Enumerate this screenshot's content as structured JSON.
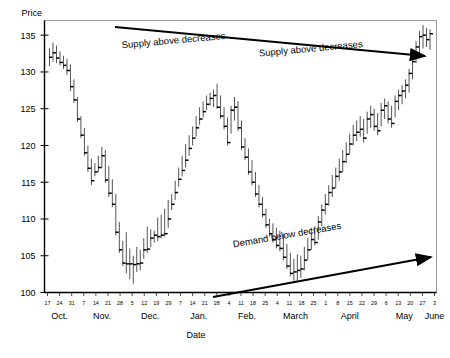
{
  "chart_data": {
    "type": "bar",
    "title": "",
    "subtitle": "",
    "ylabel": "Price",
    "xlabel": "Date",
    "ylim": [
      100,
      137
    ],
    "yticks": [
      100,
      105,
      110,
      115,
      120,
      125,
      130,
      135
    ],
    "grid": false,
    "legend": null,
    "style": "ohlc-hlc-price-bars",
    "annotations": [
      {
        "name": "supply-arrow-label-1",
        "text": "Supply above decreases",
        "x": 0.33,
        "y": 0.085,
        "rotate": -5.2
      },
      {
        "name": "supply-arrow-label-2",
        "text": "Supply above decreases",
        "x": 0.68,
        "y": 0.115,
        "rotate": -5.2
      },
      {
        "name": "demand-arrow-label",
        "text": "Demand below decreases",
        "x": 0.62,
        "y": 0.8,
        "rotate": -9.8
      }
    ],
    "arrows": [
      {
        "name": "supply-trendline-arrow",
        "x1": 115,
        "y1": 27,
        "x2": 425,
        "y2": 56,
        "direction": "down-right"
      },
      {
        "name": "demand-trendline-arrow",
        "x1": 213,
        "y1": 297,
        "x2": 431,
        "y2": 257,
        "direction": "up-right"
      }
    ],
    "month_labels": [
      "Oct.",
      "Nov.",
      "Dec.",
      "Jan.",
      "Feb.",
      "March",
      "April",
      "May",
      "June"
    ],
    "day_ticks": [
      "17",
      "24",
      "31",
      "7",
      "14",
      "21",
      "28",
      "5",
      "12",
      "19",
      "29",
      "7",
      "14",
      "21",
      "28",
      "4",
      "11",
      "18",
      "25",
      "4",
      "11",
      "18",
      "25",
      "1",
      "8",
      "15",
      "22",
      "29",
      "6",
      "13",
      "20",
      "27",
      "3"
    ],
    "x": [
      "Oct 17",
      "Oct 24",
      "Oct 31",
      "Nov 7",
      "Nov 14",
      "Nov 21",
      "Nov 28",
      "Dec 5",
      "Dec 12",
      "Dec 19",
      "Dec 29",
      "Jan 7",
      "Jan 14",
      "Jan 21",
      "Jan 28",
      "Feb 4",
      "Feb 11",
      "Feb 18",
      "Feb 25",
      "Mar 4",
      "Mar 11",
      "Mar 18",
      "Mar 25",
      "Apr 1",
      "Apr 8",
      "Apr 15",
      "Apr 22",
      "Apr 29",
      "May 6",
      "May 13",
      "May 20",
      "May 27",
      "Jun 3"
    ],
    "series": [
      {
        "name": "Price (high-low-close bars)",
        "bars": [
          [
            133.2,
            130.8,
            132.0
          ],
          [
            134.0,
            131.4,
            132.6
          ],
          [
            133.6,
            131.2,
            131.9
          ],
          [
            132.8,
            130.9,
            131.3
          ],
          [
            132.2,
            130.4,
            130.9
          ],
          [
            131.8,
            129.6,
            130.2
          ],
          [
            131.0,
            127.4,
            128.0
          ],
          [
            129.0,
            125.8,
            126.2
          ],
          [
            126.6,
            123.2,
            123.6
          ],
          [
            124.0,
            121.0,
            121.4
          ],
          [
            122.4,
            118.6,
            119.0
          ],
          [
            120.0,
            116.4,
            116.9
          ],
          [
            118.2,
            114.6,
            115.2
          ],
          [
            117.6,
            115.8,
            116.4
          ],
          [
            118.6,
            116.4,
            117.0
          ],
          [
            119.8,
            116.9,
            118.6
          ],
          [
            119.4,
            114.9,
            115.3
          ],
          [
            117.2,
            113.0,
            113.5
          ],
          [
            115.4,
            111.6,
            112.0
          ],
          [
            113.4,
            107.8,
            108.2
          ],
          [
            109.6,
            105.4,
            105.8
          ],
          [
            107.0,
            103.6,
            104.0
          ],
          [
            108.2,
            102.6,
            103.9
          ],
          [
            106.0,
            101.8,
            103.9
          ],
          [
            105.0,
            101.2,
            103.8
          ],
          [
            106.2,
            102.8,
            103.9
          ],
          [
            105.8,
            103.0,
            104.0
          ],
          [
            107.4,
            104.6,
            105.8
          ],
          [
            109.0,
            105.4,
            105.9
          ],
          [
            108.6,
            106.2,
            107.4
          ],
          [
            108.4,
            106.8,
            107.8
          ],
          [
            110.2,
            107.0,
            107.6
          ],
          [
            110.6,
            107.4,
            107.8
          ],
          [
            111.4,
            107.6,
            108.0
          ],
          [
            112.6,
            108.8,
            110.0
          ],
          [
            113.4,
            111.2,
            112.0
          ],
          [
            115.2,
            112.6,
            113.6
          ],
          [
            117.0,
            114.4,
            115.4
          ],
          [
            118.6,
            115.8,
            116.6
          ],
          [
            120.2,
            117.0,
            118.0
          ],
          [
            121.4,
            118.6,
            119.6
          ],
          [
            122.6,
            120.0,
            121.0
          ],
          [
            124.0,
            121.2,
            122.4
          ],
          [
            125.2,
            122.8,
            123.6
          ],
          [
            126.0,
            123.8,
            124.6
          ],
          [
            126.8,
            124.8,
            125.6
          ],
          [
            127.2,
            125.4,
            126.4
          ],
          [
            127.6,
            125.2,
            126.8
          ],
          [
            128.4,
            125.0,
            125.2
          ],
          [
            126.8,
            123.6,
            124.0
          ],
          [
            125.2,
            122.2,
            122.6
          ],
          [
            123.8,
            120.0,
            120.4
          ],
          [
            125.4,
            121.6,
            124.8
          ],
          [
            126.6,
            123.4,
            125.2
          ],
          [
            126.0,
            122.0,
            122.4
          ],
          [
            123.4,
            119.4,
            119.8
          ],
          [
            121.0,
            118.0,
            118.4
          ],
          [
            119.6,
            116.0,
            116.4
          ],
          [
            118.0,
            114.6,
            115.0
          ],
          [
            116.4,
            113.0,
            113.4
          ],
          [
            114.6,
            111.6,
            112.0
          ],
          [
            113.0,
            110.2,
            110.6
          ],
          [
            111.4,
            108.8,
            109.2
          ],
          [
            110.0,
            107.6,
            108.0
          ],
          [
            109.4,
            106.8,
            107.2
          ],
          [
            108.8,
            106.0,
            106.4
          ],
          [
            108.4,
            105.6,
            106.0
          ],
          [
            108.0,
            104.4,
            104.8
          ],
          [
            106.6,
            103.2,
            103.6
          ],
          [
            105.4,
            102.2,
            102.6
          ],
          [
            104.6,
            101.6,
            102.8
          ],
          [
            105.2,
            101.4,
            103.0
          ],
          [
            105.0,
            102.0,
            103.2
          ],
          [
            106.2,
            103.0,
            104.4
          ],
          [
            107.4,
            104.4,
            105.8
          ],
          [
            108.8,
            105.8,
            107.2
          ],
          [
            109.0,
            106.4,
            106.8
          ],
          [
            110.4,
            107.2,
            109.6
          ],
          [
            112.0,
            109.0,
            111.2
          ],
          [
            113.4,
            110.6,
            112.0
          ],
          [
            114.6,
            111.8,
            113.6
          ],
          [
            116.0,
            113.0,
            114.2
          ],
          [
            117.0,
            114.2,
            115.8
          ],
          [
            118.2,
            115.2,
            116.4
          ],
          [
            119.4,
            116.4,
            117.8
          ],
          [
            120.4,
            117.6,
            118.8
          ],
          [
            121.6,
            118.8,
            120.2
          ],
          [
            122.8,
            120.0,
            121.4
          ],
          [
            123.4,
            120.6,
            121.8
          ],
          [
            124.0,
            121.2,
            122.2
          ],
          [
            123.6,
            120.4,
            121.0
          ],
          [
            124.6,
            121.6,
            123.6
          ],
          [
            125.4,
            122.4,
            124.2
          ],
          [
            125.0,
            122.0,
            122.6
          ],
          [
            124.4,
            121.4,
            122.0
          ],
          [
            125.8,
            122.6,
            124.8
          ],
          [
            126.4,
            123.6,
            125.4
          ],
          [
            126.0,
            123.0,
            123.6
          ],
          [
            125.4,
            122.4,
            123.0
          ],
          [
            126.8,
            123.8,
            126.0
          ],
          [
            127.6,
            124.8,
            126.8
          ],
          [
            128.2,
            125.6,
            127.4
          ],
          [
            129.0,
            126.4,
            128.2
          ],
          [
            130.4,
            127.2,
            129.8
          ],
          [
            132.0,
            129.0,
            131.4
          ],
          [
            134.2,
            131.2,
            133.4
          ],
          [
            135.6,
            132.4,
            134.8
          ],
          [
            136.4,
            133.2,
            135.0
          ],
          [
            136.0,
            133.4,
            134.4
          ],
          [
            135.8,
            133.0,
            135.2
          ]
        ]
      }
    ]
  },
  "axes": {
    "y_title": "Price",
    "x_title": "Date"
  }
}
